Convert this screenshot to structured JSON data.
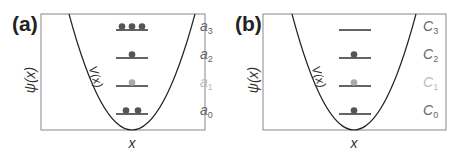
{
  "colors": {
    "frame": "#888888",
    "curve": "#222222",
    "level_line": "#222222",
    "dot_dark": "#555555",
    "dot_light": "#aaaaaa",
    "label_dark": "#666666",
    "label_light": "#bbbbbb"
  },
  "panels": [
    {
      "id": "a",
      "panel_label": "(a)",
      "y_axis_label": "ψ(x)",
      "x_axis_label": "x",
      "curve_label": "V(x)",
      "levels": [
        {
          "name": "a",
          "index": "3",
          "dots": 3,
          "dot_style": "dark",
          "label_style": "dark"
        },
        {
          "name": "a",
          "index": "2",
          "dots": 1,
          "dot_style": "dark",
          "label_style": "dark"
        },
        {
          "name": "a",
          "index": "1",
          "dots": 1,
          "dot_style": "light",
          "label_style": "light"
        },
        {
          "name": "a",
          "index": "0",
          "dots": 2,
          "dot_style": "dark",
          "label_style": "dark"
        }
      ]
    },
    {
      "id": "b",
      "panel_label": "(b)",
      "y_axis_label": "ψ(x)",
      "x_axis_label": "x",
      "curve_label": "V(x)",
      "levels": [
        {
          "name": "C",
          "index": "3",
          "dots": 0,
          "dot_style": "dark",
          "label_style": "dark"
        },
        {
          "name": "C",
          "index": "2",
          "dots": 1,
          "dot_style": "dark",
          "label_style": "dark"
        },
        {
          "name": "C",
          "index": "1",
          "dots": 1,
          "dot_style": "light",
          "label_style": "light"
        },
        {
          "name": "C",
          "index": "0",
          "dots": 1,
          "dot_style": "dark",
          "label_style": "dark"
        }
      ]
    }
  ]
}
